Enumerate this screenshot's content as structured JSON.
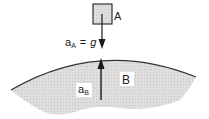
{
  "diagram": {
    "body_a": {
      "label": "A"
    },
    "acceleration_a": {
      "symbol": "a",
      "subscript": "A",
      "equals": "=",
      "value": "g"
    },
    "body_b": {
      "label": "B"
    },
    "acceleration_b": {
      "symbol": "a",
      "subscript": "B"
    },
    "colors": {
      "fill": "#d8d8d8",
      "outline": "#333333",
      "arrow": "#1a1a1a",
      "label_bg": "#ffffff"
    }
  }
}
